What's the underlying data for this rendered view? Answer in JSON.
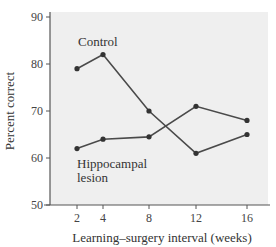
{
  "chart_data": {
    "type": "line",
    "title": "",
    "xlabel": "Learning–surgery interval (weeks)",
    "ylabel": "Percent correct",
    "x": [
      2,
      4,
      8,
      12,
      16
    ],
    "xticks": [
      "2",
      "4",
      "8",
      "12",
      "16"
    ],
    "yticks": [
      "50",
      "60",
      "70",
      "80",
      "90"
    ],
    "ylim": [
      50,
      90
    ],
    "grid": false,
    "legend": "inline labels",
    "series": [
      {
        "name": "Control",
        "label_lines": [
          "Control"
        ],
        "values": [
          79,
          82,
          70,
          61,
          65
        ]
      },
      {
        "name": "Hippocampal lesion",
        "label_lines": [
          "Hippocampal",
          "lesion"
        ],
        "values": [
          62,
          64,
          64.5,
          71,
          68
        ]
      }
    ],
    "colors": {
      "plot_background": "#efefef",
      "line": "#4a4a4a",
      "axis": "#555555"
    }
  }
}
